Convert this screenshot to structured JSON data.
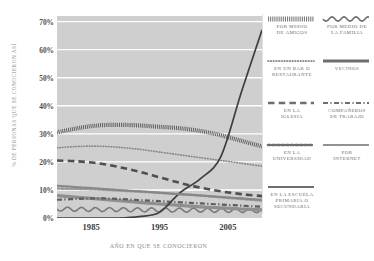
{
  "chart_data": {
    "type": "line",
    "title": "",
    "xlabel": "AÑO EN QUE SE CONOCIERON",
    "ylabel": "% DE PERSONAS QUE SE CONOCIERON ASÍ",
    "xlim": [
      1980,
      2010
    ],
    "ylim": [
      0,
      72
    ],
    "grid": true,
    "grid_color": "#ffffff",
    "plot_background": "#cfcfcf",
    "legend_position": "right",
    "xticks": [
      "1985",
      "1995",
      "2005"
    ],
    "xtick_values": [
      1985,
      1995,
      2005
    ],
    "yticks": [
      "0%",
      "10%",
      "20%",
      "30%",
      "40%",
      "50%",
      "60%",
      "70%"
    ],
    "ytick_values": [
      0,
      10,
      20,
      30,
      40,
      50,
      60,
      70
    ],
    "x": [
      1980,
      1983,
      1986,
      1989,
      1992,
      1995,
      1998,
      2001,
      2004,
      2007,
      2010
    ],
    "series": [
      {
        "name": "POR MEDIO DE AMIGOS",
        "style": "dense-hatch",
        "color": "#595959",
        "values": [
          30.5,
          32.0,
          33.0,
          33.2,
          33.0,
          32.5,
          32.0,
          31.0,
          29.5,
          27.5,
          25.5
        ]
      },
      {
        "name": "POR MEDIO DE LA FAMILIA",
        "style": "wavy",
        "color": "#7a7a7a",
        "values": [
          3.2,
          3.1,
          3.0,
          3.0,
          2.9,
          2.9,
          2.8,
          2.8,
          2.7,
          2.7,
          2.6
        ]
      },
      {
        "name": "EN UN BAR O RESTAURANTE",
        "style": "dotted",
        "color": "#8a8a8a",
        "values": [
          25.0,
          25.5,
          25.6,
          25.2,
          24.5,
          23.5,
          22.5,
          21.5,
          20.5,
          19.5,
          18.5
        ]
      },
      {
        "name": "VECINOS",
        "style": "solid-thick",
        "color": "#8f8f8f",
        "values": [
          8.0,
          7.4,
          6.8,
          6.2,
          5.6,
          5.0,
          4.5,
          4.0,
          3.6,
          3.2,
          2.9
        ]
      },
      {
        "name": "EN LA IGLESIA",
        "style": "dashed",
        "color": "#4f4f4f",
        "values": [
          20.5,
          20.2,
          19.5,
          18.2,
          16.5,
          14.5,
          12.5,
          10.8,
          9.5,
          8.5,
          7.8
        ]
      },
      {
        "name": "COMPAÑEROS DE TRABAJO",
        "style": "dash-dot",
        "color": "#5d5d5d",
        "values": [
          6.5,
          6.8,
          7.0,
          6.8,
          6.4,
          6.0,
          5.6,
          5.2,
          4.8,
          4.4,
          4.0
        ]
      },
      {
        "name": "EN LA UNIVERSIDAD",
        "style": "beaded",
        "color": "#9a9a9a",
        "values": [
          10.5,
          10.4,
          10.2,
          9.8,
          9.4,
          9.0,
          8.5,
          8.0,
          7.4,
          6.8,
          6.2
        ]
      },
      {
        "name": "POR INTERNET",
        "style": "solid-thin",
        "color": "#3f3f3f",
        "values": [
          0,
          0,
          0,
          0,
          0.5,
          2.0,
          9.0,
          14.0,
          22.0,
          45.0,
          67.0
        ]
      },
      {
        "name": "EN LA ESCUELA PRIMARIA O SECUNDARIA",
        "style": "solid-medium",
        "color": "#878787",
        "values": [
          11.5,
          11.0,
          10.5,
          10.0,
          9.5,
          9.0,
          8.5,
          8.0,
          7.5,
          7.0,
          6.5
        ]
      }
    ]
  },
  "legend": {
    "items": [
      {
        "label_line1": "POR MEDIO",
        "label_line2": "DE AMIGOS",
        "style": "dense-hatch"
      },
      {
        "label_line1": "POR MEDIO DE",
        "label_line2": "LA FAMILIA",
        "style": "wavy"
      },
      {
        "label_line1": "EN UN BAR O",
        "label_line2": "RESTAURANTE",
        "style": "dotted"
      },
      {
        "label_line1": "VECINOS",
        "label_line2": "",
        "style": "solid-thick"
      },
      {
        "label_line1": "EN LA",
        "label_line2": "IGLESIA",
        "style": "dashed"
      },
      {
        "label_line1": "COMPAÑEROS",
        "label_line2": "DE TRABAJO",
        "style": "dash-dot"
      },
      {
        "label_line1": "EN LA",
        "label_line2": "UNIVERSIDAD",
        "style": "beaded"
      },
      {
        "label_line1": "POR",
        "label_line2": "INTERNET",
        "style": "solid-thin"
      },
      {
        "label_line1": "EN LA ESCUELA",
        "label_line2": "PRIMARIA O SECUNDARIA",
        "style": "solid-medium"
      }
    ]
  }
}
